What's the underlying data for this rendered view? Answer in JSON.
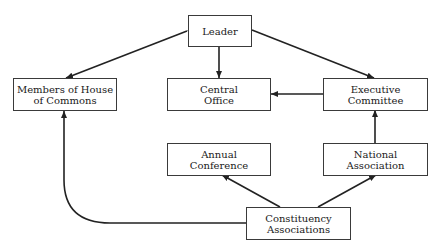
{
  "diagram": {
    "type": "organizational-flow",
    "nodes": {
      "leader": {
        "label": "Leader"
      },
      "members": {
        "label": "Members of House\nof Commons"
      },
      "central_office": {
        "label": "Central\nOffice"
      },
      "executive_committee": {
        "label": "Executive\nCommittee"
      },
      "annual_conference": {
        "label": "Annual\nConference"
      },
      "national_association": {
        "label": "National\nAssociation"
      },
      "constituency_associations": {
        "label": "Constituency\nAssociations"
      }
    },
    "edges": [
      {
        "from": "leader",
        "to": "members",
        "bidirectional": true
      },
      {
        "from": "leader",
        "to": "central_office",
        "bidirectional": false
      },
      {
        "from": "leader",
        "to": "executive_committee",
        "bidirectional": false
      },
      {
        "from": "executive_committee",
        "to": "central_office",
        "bidirectional": false
      },
      {
        "from": "national_association",
        "to": "executive_committee",
        "bidirectional": false
      },
      {
        "from": "constituency_associations",
        "to": "annual_conference",
        "bidirectional": false
      },
      {
        "from": "constituency_associations",
        "to": "national_association",
        "bidirectional": false
      },
      {
        "from": "constituency_associations",
        "to": "members",
        "bidirectional": false
      }
    ],
    "colors": {
      "line": "#222222",
      "border": "#3a3a3a",
      "text": "#1a1a1a",
      "background": "#ffffff"
    }
  }
}
